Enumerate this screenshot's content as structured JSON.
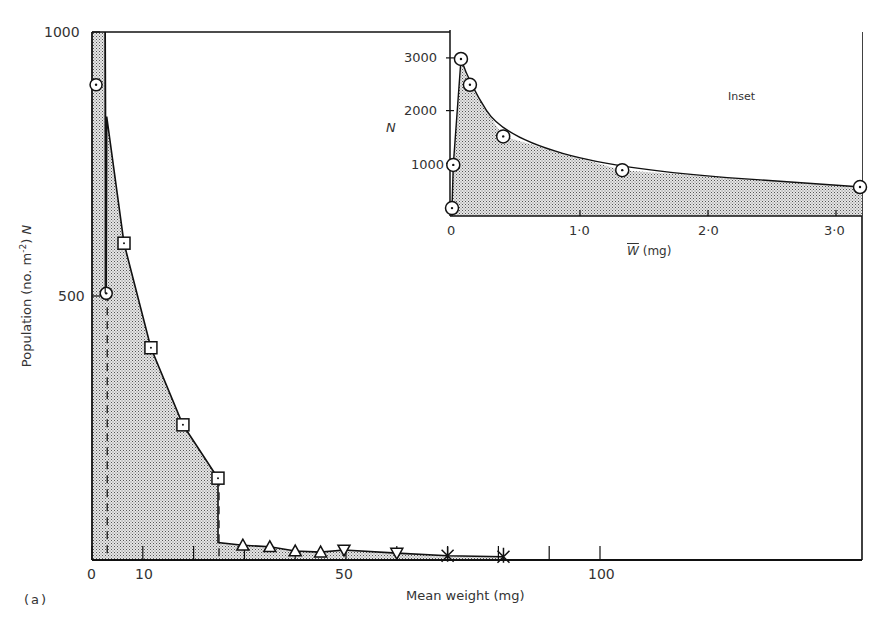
{
  "figure": {
    "panel_label": "(a)",
    "inset_label": "Inset"
  },
  "chart_data": [
    {
      "type": "area",
      "title": "",
      "panel": "(a)",
      "xlabel": "Mean weight (mg)",
      "ylabel": "Population (no. m-2) N",
      "ylabel_parts": {
        "main": "Population (no. m",
        "sup": "-2",
        "tail": ") ",
        "italic": "N"
      },
      "xlim": [
        0,
        152
      ],
      "ylim": [
        0,
        1000
      ],
      "xticks": [
        0,
        10,
        50,
        100
      ],
      "xtick_labels": [
        "0",
        "10",
        "50",
        "100"
      ],
      "minor_xticks": [
        20,
        30,
        40,
        60,
        70,
        80,
        90
      ],
      "yticks": [
        500,
        1000
      ],
      "ytick_labels": [
        "500",
        "1000"
      ],
      "grid": false,
      "fill": "stippled grey under curve",
      "dashed_verticals_x": [
        3,
        25
      ],
      "series": [
        {
          "name": "circles",
          "marker": "circle",
          "x": [
            0.8,
            2.8
          ],
          "y": [
            900,
            505
          ]
        },
        {
          "name": "squares",
          "marker": "square",
          "x": [
            6.3,
            11.6,
            17.9,
            24.8
          ],
          "y": [
            600,
            402,
            256,
            155
          ]
        },
        {
          "name": "triangles",
          "marker": "triangle-up",
          "x": [
            29.7,
            35.0,
            40.0,
            45.0
          ],
          "y": [
            28,
            25,
            17,
            15
          ]
        },
        {
          "name": "inverted triangles",
          "marker": "triangle-down",
          "x": [
            49.6,
            60.0
          ],
          "y": [
            19,
            13
          ]
        },
        {
          "name": "crosses",
          "marker": "cross",
          "x": [
            70.0,
            81.0
          ],
          "y": [
            8,
            6
          ]
        }
      ],
      "envelope_curve": {
        "x": [
          0,
          0,
          2.6,
          2.8,
          2.9,
          6.3,
          11.6,
          17.9,
          24.8,
          24.8,
          29.7,
          35,
          40,
          45,
          49.6,
          60,
          70,
          81
        ],
        "y": [
          0,
          1000,
          1000,
          505,
          840,
          600,
          402,
          256,
          155,
          33,
          28,
          25,
          17,
          15,
          19,
          13,
          8,
          6
        ]
      }
    },
    {
      "type": "area",
      "title": "Inset",
      "xlabel": "W̄ (mg)",
      "ylabel": "N",
      "xlim": [
        0,
        3.2
      ],
      "ylim": [
        0,
        3500
      ],
      "xticks": [
        0,
        1.0,
        2.0,
        3.0
      ],
      "xtick_labels": [
        "0",
        "1·0",
        "2·0",
        "3·0"
      ],
      "yticks": [
        1000,
        2000,
        3000
      ],
      "ytick_labels": [
        "1000",
        "2000",
        "3000"
      ],
      "grid": false,
      "series": [
        {
          "name": "circles",
          "marker": "circle",
          "x": [
            0.0,
            0.01,
            0.07,
            0.14,
            0.4,
            1.33,
            3.2
          ],
          "y": [
            150,
            970,
            2980,
            2490,
            1510,
            870,
            550
          ]
        }
      ]
    }
  ]
}
